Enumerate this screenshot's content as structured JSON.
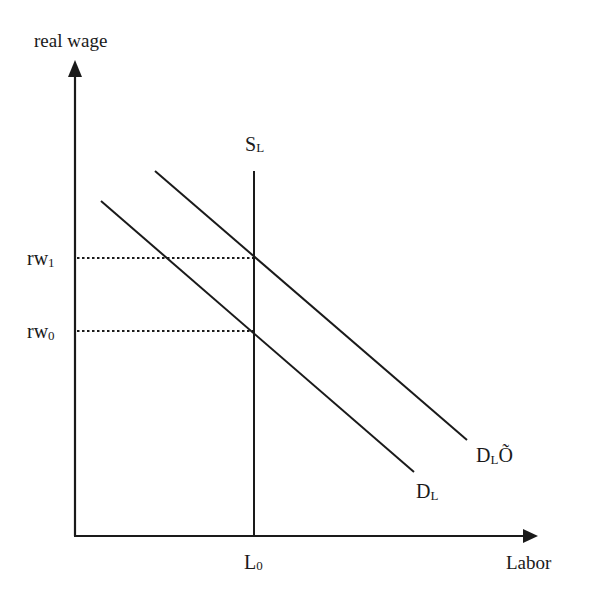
{
  "diagram": {
    "y_axis": {
      "label": "real wage"
    },
    "x_axis": {
      "label": "Labor"
    },
    "curves": [
      {
        "id": "SL",
        "label_main": "S",
        "label_sub": "L",
        "type": "vertical supply"
      },
      {
        "id": "DL",
        "label_main": "D",
        "label_sub": "L",
        "type": "demand"
      },
      {
        "id": "DL_prime",
        "label_main": "D",
        "label_sub": "L",
        "label_suffix": "Õ",
        "type": "shifted demand"
      }
    ],
    "levels": {
      "rw1": {
        "label_main": "rw",
        "label_sub": "1"
      },
      "rw0": {
        "label_main": "rw",
        "label_sub": "0"
      },
      "L0": {
        "label_main": "L",
        "label_sub": "0"
      }
    },
    "colors": {
      "line": "#1a1a1a",
      "background": "#ffffff"
    }
  }
}
